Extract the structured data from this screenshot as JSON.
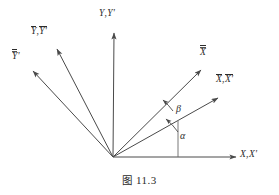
{
  "figure": {
    "caption_cjk": "图",
    "caption_number": "11.3",
    "caption_full": "图 11.3",
    "line_color": "#4a4a4a",
    "text_color": "#2b2b2b",
    "background": "#ffffff",
    "origin": {
      "x": 113,
      "y": 157
    }
  },
  "labels": {
    "y_axis": {
      "base": "Y",
      "sep": ",",
      "prime": "Y'",
      "text": "Y, Y'"
    },
    "y_bar": {
      "base": "Y",
      "sep": ",",
      "prime": "Y'",
      "text": "Ȳ, Ȳ'"
    },
    "y_dbar": {
      "base": "Y",
      "prime": "'",
      "text": "Ȳ̄'"
    },
    "x_dbar": {
      "base": "X",
      "text": "X̿"
    },
    "x_bar": {
      "base": "X",
      "sep": ",",
      "prime": "X'",
      "text": "X̄, X̄'"
    },
    "x_axis": {
      "base": "X",
      "sep": ",",
      "prime": "X'",
      "text": "X, X'"
    }
  },
  "angles": {
    "alpha": {
      "symbol": "α",
      "between": "X axis and X-bar axis"
    },
    "beta": {
      "symbol": "β",
      "between": "X-bar axis and X-double-bar axis"
    }
  },
  "rays": [
    {
      "name": "y-axis-ray",
      "label": "Y, Y'",
      "tip": {
        "x": 114,
        "y": 28
      }
    },
    {
      "name": "y-bar-ray",
      "label": "Ȳ, Ȳ'",
      "tip": {
        "x": 54,
        "y": 45
      }
    },
    {
      "name": "y-dbar-ray",
      "label": "Ȳ̄'",
      "tip": {
        "x": 29,
        "y": 68
      }
    },
    {
      "name": "x-dbar-ray",
      "label": "X̿",
      "tip": {
        "x": 205,
        "y": 66
      }
    },
    {
      "name": "x-bar-ray",
      "label": "X̄, X̄'",
      "tip": {
        "x": 222,
        "y": 95
      }
    },
    {
      "name": "x-axis-ray",
      "label": "X, X'",
      "tip": {
        "x": 240,
        "y": 157
      }
    }
  ]
}
